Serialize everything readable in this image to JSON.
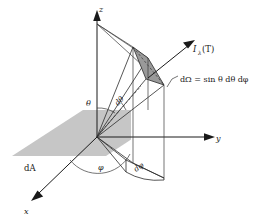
{
  "figure": {
    "type": "diagram",
    "width": 257,
    "height": 223,
    "background_color": "#ffffff"
  },
  "colors": {
    "plane_gray": "#c6c6c6",
    "patch_gray": "#9a9a9a",
    "line_black": "#1a1a1a",
    "line_dark_gray": "#2b2b2b",
    "label_color": "#1a1a1a"
  },
  "axes": [
    {
      "name": "z-axis",
      "label": "z",
      "direction": "up",
      "tip_x": 97,
      "tip_y": 11
    },
    {
      "name": "y-axis",
      "label": "y",
      "direction": "right",
      "tip_x": 214,
      "tip_y": 137
    },
    {
      "name": "x-axis",
      "label": "x",
      "direction": "down-left",
      "tip_x": 32,
      "tip_y": 199
    }
  ],
  "labels": {
    "z_axis": "z",
    "y_axis": "y",
    "x_axis": "x",
    "theta": "θ",
    "phi": "φ",
    "d_theta": "dθ",
    "d_phi": "dφ",
    "area_element": "dA",
    "radiance": "I",
    "radiance_subscript": "λ",
    "radiance_argument": "(T)",
    "solid_angle_equation": "dΩ = sin θ dθ dφ"
  },
  "annotations": {
    "radiance_label_full": "Iλ(T)",
    "solid_angle_symbol": "dΩ",
    "solid_angle_expression": "sin θ dθ dφ",
    "plane_label": "dA"
  },
  "elements": {
    "plane": {
      "name": "horizontal-area-plane",
      "label": "dA",
      "fill": "#c6c6c6"
    },
    "solid_angle_patch": {
      "name": "solid-angle-patch",
      "label": "dΩ",
      "fill": "#9a9a9a"
    },
    "ray": {
      "name": "radiance-ray",
      "label": "Iλ(T)"
    }
  }
}
